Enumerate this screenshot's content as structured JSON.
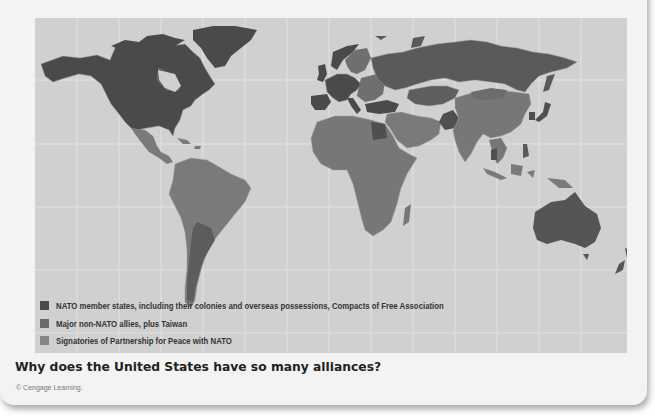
{
  "figure": {
    "question": "Why does the United States have so many alliances?",
    "credit": "© Cengage Learning."
  },
  "map": {
    "ocean_color": "#d0d0d0",
    "gridline_color": "#e4e4e4",
    "border_color": "#a8a8a8",
    "legend": [
      {
        "label": "NATO member states, including their colonies and overseas possessions, Compacts of Free Association",
        "color": "#4a4a4a"
      },
      {
        "label": "Major non-NATO allies, plus Taiwan",
        "color": "#6a6a6a"
      },
      {
        "label": "Signatories of Partnership for Peace with NATO",
        "color": "#858585"
      }
    ],
    "categories": {
      "nato": [
        "United States",
        "Canada",
        "Greenland",
        "United Kingdom",
        "France",
        "Germany",
        "Spain",
        "Portugal",
        "Italy",
        "Norway",
        "Poland",
        "Turkey",
        "Netherlands",
        "Belgium"
      ],
      "major_non_nato": [
        "Australia",
        "New Zealand",
        "Japan",
        "South Korea",
        "Argentina",
        "Egypt",
        "Pakistan",
        "Thailand",
        "Taiwan",
        "Philippines",
        "Israel",
        "Jordan"
      ],
      "partnership_for_peace": [
        "Russia",
        "Kazakhstan",
        "Uzbekistan",
        "Turkmenistan",
        "Ukraine",
        "Belarus",
        "Sweden",
        "Finland",
        "Austria",
        "Switzerland",
        "Georgia",
        "Armenia",
        "Azerbaijan"
      ],
      "other": [
        "Mexico",
        "Brazil",
        "China",
        "India",
        "Africa (most)",
        "Middle East (most)",
        "Indonesia",
        "Mongolia"
      ]
    }
  }
}
